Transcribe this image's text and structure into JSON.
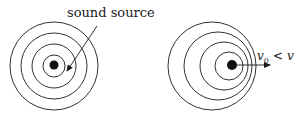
{
  "diagram": {
    "left_panel": {
      "label": "sound source",
      "description": "stationary source, concentric wavefronts",
      "center": [
        54,
        66
      ],
      "radii": [
        11,
        22,
        33,
        44
      ],
      "source_dot_radius": 4.5,
      "label_position": [
        70,
        21
      ],
      "pointer_from": [
        97,
        26
      ],
      "pointer_to": [
        66,
        73
      ]
    },
    "right_panel": {
      "description": "moving source, wavefronts compressed ahead",
      "circles": [
        {
          "cx": 212,
          "cy": 66,
          "r": 44
        },
        {
          "cx": 218,
          "cy": 66,
          "r": 34
        },
        {
          "cx": 224,
          "cy": 66,
          "r": 24
        },
        {
          "cx": 229,
          "cy": 66,
          "r": 14
        }
      ],
      "source_center": [
        232,
        65
      ],
      "source_dot_radius": 5,
      "arrow_from": [
        236,
        65
      ],
      "arrow_to": [
        270,
        65
      ],
      "velocity_label": {
        "v": "v",
        "subscript": "0",
        "relation": "<",
        "rhs": "v"
      }
    },
    "stroke_color": "#1a1a1a"
  }
}
